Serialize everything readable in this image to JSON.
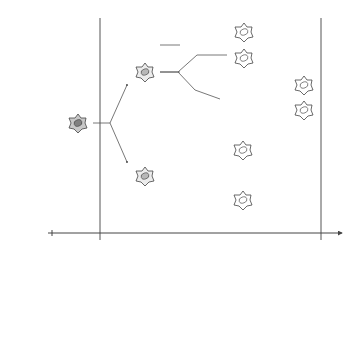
{
  "labels": {
    "y_axis_top": "division process",
    "y_axis_bottom_line1": "label density at",
    "y_axis_bottom_line2": "different times",
    "t0": "t = 0",
    "t1": "t",
    "t1_sub": "1",
    "t2": "t",
    "t2_sub": "2",
    "time_axis": "time t",
    "left_box_axis": "label concentration x",
    "right_box_axis": "label concentration x"
  },
  "colors": {
    "line": "#555555",
    "cell_fill_root": "#c8c8c8",
    "cell_fill_gen1": "#e8e8e8",
    "cell_fill_gen2": "#ffffff",
    "nucleus_root": "#808080",
    "nucleus_gen1": "#b0b0b0"
  },
  "tree": {
    "root": {
      "x": 78,
      "y": 123
    },
    "generation1": [
      {
        "x": 145,
        "y": 72
      },
      {
        "x": 145,
        "y": 176
      }
    ],
    "generation2": [
      {
        "x": 244,
        "y": 32
      },
      {
        "x": 244,
        "y": 58
      },
      {
        "x": 304,
        "y": 85
      },
      {
        "x": 304,
        "y": 110
      },
      {
        "x": 243,
        "y": 150
      },
      {
        "x": 243,
        "y": 200
      }
    ]
  }
}
